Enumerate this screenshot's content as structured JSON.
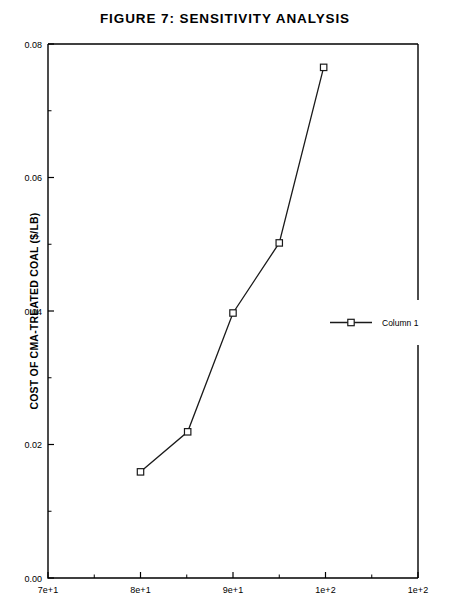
{
  "figure": {
    "title": "FIGURE 7:  SENSITIVITY ANALYSIS"
  },
  "chart_data": {
    "type": "line",
    "title": "FIGURE 7:  SENSITIVITY ANALYSIS",
    "xlabel": "",
    "ylabel": "COST OF CMA-TREATED COAL ($/LB)",
    "xlim": [
      70,
      110
    ],
    "ylim": [
      0.0,
      0.08
    ],
    "grid": false,
    "legend_position": "right",
    "x_tick_labels": [
      "7e+1",
      "8e+1",
      "9e+1",
      "1e+2",
      "1e+2"
    ],
    "x_tick_values": [
      70,
      80,
      90,
      100,
      110
    ],
    "y_tick_labels": [
      "0.00",
      "0.02",
      "0.04",
      "0.06",
      "0.08"
    ],
    "y_tick_values": [
      0.0,
      0.02,
      0.04,
      0.06,
      0.08
    ],
    "x_minor_count": 1,
    "y_minor_count": 1,
    "series": [
      {
        "name": "Column 1",
        "marker": "square",
        "color": "#1a1a1a",
        "x": [
          80.0,
          85.1,
          90.0,
          95.0,
          99.8
        ],
        "y": [
          0.0159,
          0.0219,
          0.0397,
          0.0502,
          0.0765
        ]
      }
    ]
  },
  "legend": {
    "entries": [
      {
        "label": "Column 1",
        "marker": "square"
      }
    ]
  },
  "axes": {
    "y_title": "COST OF CMA-TREATED COAL ($/LB)"
  }
}
